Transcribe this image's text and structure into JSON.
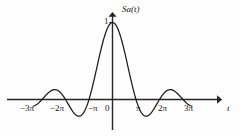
{
  "figure": {
    "background_color": "#fdfdfd",
    "curve_color": "#1a1a1a",
    "axis_color": "#262626",
    "text_color": "#171717"
  },
  "labels": {
    "y_axis_name": "Sa(t)",
    "x_axis_name": "t",
    "peak_value": "1",
    "origin": "0"
  },
  "x_ticks": [
    {
      "text": "−3π",
      "x": 20,
      "y": 103
    },
    {
      "text": "−2π",
      "x": 50,
      "y": 103
    },
    {
      "text": "−π",
      "x": 88,
      "y": 103
    },
    {
      "text": "0",
      "x": 105,
      "y": 103
    },
    {
      "text": "π",
      "x": 136,
      "y": 103
    },
    {
      "text": "2π",
      "x": 158,
      "y": 103
    },
    {
      "text": "3π",
      "x": 184,
      "y": 103
    }
  ],
  "chart_data": {
    "type": "line",
    "title": "",
    "subtitle": "",
    "xlabel": "t",
    "ylabel": "Sa(t)",
    "function": "Sa(t) = sin(t)/t",
    "grid": false,
    "legend": null,
    "xlim": [
      -11.0,
      12.2
    ],
    "ylim": [
      -0.27,
      1.12
    ],
    "xtick_values": [
      -9.4248,
      -6.2832,
      -3.1416,
      0,
      3.1416,
      6.2832,
      9.4248
    ],
    "xtick_labels": [
      "−3π",
      "−2π",
      "−π",
      "0",
      "π",
      "2π",
      "3π"
    ],
    "ytick_values": [
      1
    ],
    "ytick_labels": [
      "1"
    ],
    "zero_crossings": [
      -9.4248,
      -6.2832,
      -3.1416,
      3.1416,
      6.2832,
      9.4248
    ],
    "extrema": [
      {
        "x": 0,
        "y": 1.0,
        "kind": "main-lobe-peak"
      },
      {
        "x": -4.4934,
        "y": -0.2172,
        "kind": "minimum"
      },
      {
        "x": 4.4934,
        "y": -0.2172,
        "kind": "minimum"
      },
      {
        "x": -7.7253,
        "y": 0.1284,
        "kind": "maximum"
      },
      {
        "x": 7.7253,
        "y": 0.1284,
        "kind": "maximum"
      }
    ],
    "series": [
      {
        "name": "Sa(t)",
        "x": [
          -11.0,
          -10.6,
          -10.2,
          -9.8,
          -9.4248,
          -9.0,
          -8.6,
          -8.2,
          -7.7253,
          -7.3,
          -6.9,
          -6.5,
          -6.2832,
          -5.9,
          -5.5,
          -5.1,
          -4.4934,
          -4.0,
          -3.6,
          -3.1416,
          -2.7,
          -2.3,
          -1.9,
          -1.5,
          -1.1,
          -0.7,
          -0.3,
          0,
          0.3,
          0.7,
          1.1,
          1.5,
          1.9,
          2.3,
          2.7,
          3.1416,
          3.6,
          4.0,
          4.4934,
          5.1,
          5.5,
          5.9,
          6.2832,
          6.5,
          6.9,
          7.3,
          7.7253,
          8.2,
          8.6,
          9.0,
          9.4248,
          9.8,
          10.2,
          10.6,
          11.0
        ],
        "y": [
          -0.0909,
          -0.0866,
          -0.0615,
          -0.0234,
          0.0,
          0.0454,
          0.0852,
          0.1132,
          0.1284,
          0.1197,
          0.0868,
          0.0383,
          0.0,
          -0.0619,
          -0.128,
          -0.179,
          -0.2172,
          -0.1892,
          -0.1225,
          0.0,
          0.156,
          0.3243,
          0.4967,
          0.665,
          0.8128,
          0.9216,
          0.9851,
          1.0,
          0.9851,
          0.9216,
          0.8128,
          0.665,
          0.4967,
          0.3243,
          0.156,
          0.0,
          -0.1225,
          -0.1892,
          -0.2172,
          -0.179,
          -0.128,
          -0.0619,
          0.0,
          0.0383,
          0.0868,
          0.1197,
          0.1284,
          0.1132,
          0.0852,
          0.0454,
          0.0,
          -0.0234,
          -0.0615,
          -0.0866,
          -0.0909
        ]
      }
    ]
  }
}
